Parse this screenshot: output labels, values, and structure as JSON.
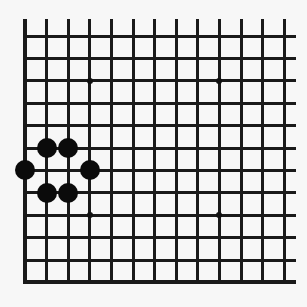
{
  "diagram": {
    "type": "go-board-fragment",
    "columns": 13,
    "rows": 12,
    "grid_origin_x": 25,
    "grid_origin_y": 36,
    "col_spacing": 21.6,
    "row_spacing": 22.4,
    "line_top_extent_y": 19,
    "line_right_extent_x": 296,
    "closed_edges": [
      "left",
      "bottom"
    ],
    "open_edges": [
      "top",
      "right"
    ],
    "colors": {
      "background": "#f7f7f7",
      "line": "#1a1a1a",
      "black_stone": "#0b0b0b"
    },
    "star_points": [
      {
        "col": 3,
        "row": 2
      },
      {
        "col": 9,
        "row": 2
      },
      {
        "col": 3,
        "row": 8
      },
      {
        "col": 9,
        "row": 8
      }
    ],
    "stones": [
      {
        "color": "black",
        "col": 1,
        "row": 5
      },
      {
        "color": "black",
        "col": 2,
        "row": 5
      },
      {
        "color": "black",
        "col": 0,
        "row": 6
      },
      {
        "color": "black",
        "col": 3,
        "row": 6
      },
      {
        "color": "black",
        "col": 1,
        "row": 7
      },
      {
        "color": "black",
        "col": 2,
        "row": 7
      }
    ]
  }
}
